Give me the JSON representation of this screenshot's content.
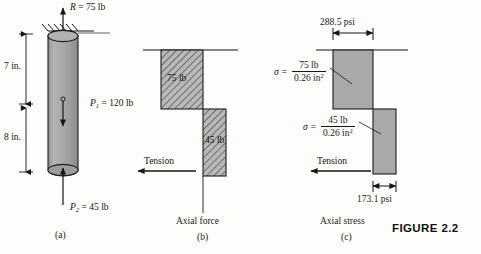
{
  "figure": {
    "title": "FIGURE 2.2",
    "background_color": "#fdfdfb",
    "bar_fill": "#a8a8a8",
    "hatch_fill": "#b0b0b0",
    "line_color": "#151515"
  },
  "panel_a": {
    "caption": "(a)",
    "reaction_label": "R",
    "reaction_value": "= 75 lb",
    "dim_top": "7 in.",
    "dim_bottom": "8 in.",
    "load_p1_symbol": "P",
    "load_p1_sub": "1",
    "load_p1_value": "= 120 lb",
    "load_p2_symbol": "P",
    "load_p2_sub": "2",
    "load_p2_value": "= 45 lb"
  },
  "panel_b": {
    "caption": "(b)",
    "axis_label": "Axial force",
    "tension_label": "Tension",
    "segment_upper_value": "75 lb",
    "segment_lower_value": "45 lb"
  },
  "panel_c": {
    "caption": "(c)",
    "axis_label": "Axial stress",
    "tension_label": "Tension",
    "stress_upper_psi": "288.5 psi",
    "stress_lower_psi": "173.1 psi",
    "sigma_symbol": "σ",
    "equals": "=",
    "sigma_upper_numerator": "75 lb",
    "sigma_upper_denominator_value": "0.26 in",
    "sigma_upper_denominator_exp": "2",
    "sigma_lower_numerator": "45 lb",
    "sigma_lower_denominator_value": "0.26 in",
    "sigma_lower_denominator_exp": "2"
  }
}
